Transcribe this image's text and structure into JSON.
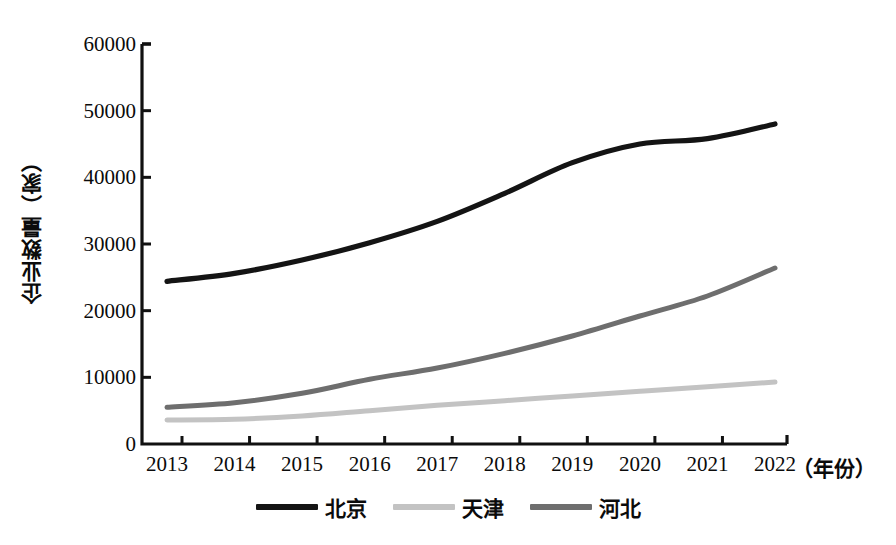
{
  "chart_data": {
    "type": "line",
    "title": "",
    "subtitle": "",
    "xlabel": "（年份）",
    "ylabel": "企业数量（家）",
    "x": [
      2013,
      2014,
      2015,
      2016,
      2017,
      2018,
      2019,
      2020,
      2021,
      2022
    ],
    "categories": [
      "2013",
      "2014",
      "2015",
      "2016",
      "2017",
      "2018",
      "2019",
      "2020",
      "2021",
      "2022"
    ],
    "xlim": [
      2013,
      2022
    ],
    "ylim": [
      0,
      60000
    ],
    "ytick_labels": [
      "0",
      "10000",
      "20000",
      "30000",
      "40000",
      "50000",
      "60000"
    ],
    "ytick_values": [
      0,
      10000,
      20000,
      30000,
      40000,
      50000,
      60000
    ],
    "grid": false,
    "legend_position": "bottom",
    "series": [
      {
        "name": "北京",
        "color": "#141414",
        "values": [
          24400,
          25600,
          27600,
          30200,
          33400,
          37600,
          42200,
          45000,
          45800,
          48000
        ]
      },
      {
        "name": "天津",
        "color": "#c3c3c3",
        "values": [
          3600,
          3700,
          4200,
          5000,
          5800,
          6500,
          7200,
          7900,
          8600,
          9300
        ]
      },
      {
        "name": "河北",
        "color": "#6e6e6e",
        "values": [
          5500,
          6200,
          7600,
          9700,
          11400,
          13600,
          16200,
          19200,
          22200,
          26400
        ]
      }
    ]
  },
  "axis": {
    "color": "#111111"
  }
}
